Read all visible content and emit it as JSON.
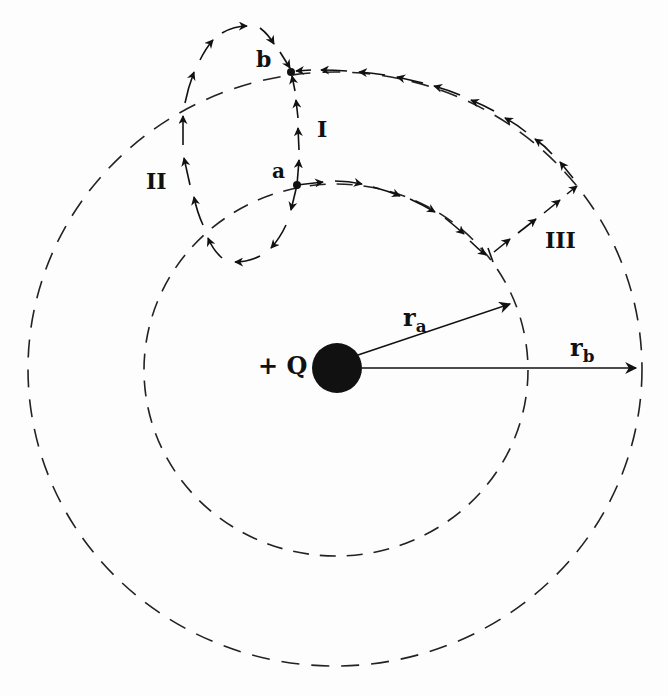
{
  "diagram": {
    "charge": {
      "label": "+ Q",
      "cx": 337,
      "cy": 368,
      "r": 25,
      "color": "#111111"
    },
    "circles": [
      {
        "name": "inner",
        "cx": 336,
        "cy": 370,
        "rx": 192,
        "ry": 186
      },
      {
        "name": "outer",
        "cx": 335,
        "cy": 369,
        "rx": 307,
        "ry": 297
      }
    ],
    "points": [
      {
        "label": "a",
        "x": 297,
        "y": 185
      },
      {
        "label": "b",
        "x": 291,
        "y": 72
      }
    ],
    "paths": [
      {
        "label": "I",
        "description": "straight-ish path from a up to b"
      },
      {
        "label": "II",
        "description": "loop path from a down-left, around, up to b"
      },
      {
        "label": "III",
        "description": "along inner circle, radially outward, along outer circle to b"
      }
    ],
    "radii": [
      {
        "label": "r",
        "sub": "a"
      },
      {
        "label": "r",
        "sub": "b"
      }
    ],
    "colors": {
      "ink": "#111111",
      "background": "#fdfdfd"
    }
  },
  "labels": {
    "charge": "+ Q",
    "point_a": "a",
    "point_b": "b",
    "path_I": "I",
    "path_II": "II",
    "path_III": "III",
    "ra_main": "r",
    "ra_sub": "a",
    "rb_main": "r",
    "rb_sub": "b"
  }
}
